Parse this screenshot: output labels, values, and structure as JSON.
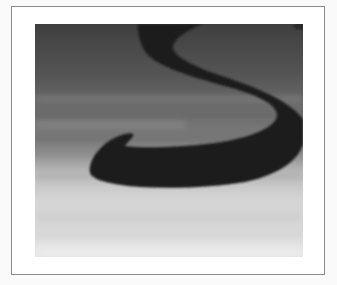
{
  "figure": {
    "frame_color": "#8a8a8a",
    "colors": {
      "background_top": "#4a4a4a",
      "background_mid": "#7a7a7a",
      "background_bottom": "#d9d9d9",
      "glyph": "#1c1c1c"
    }
  }
}
